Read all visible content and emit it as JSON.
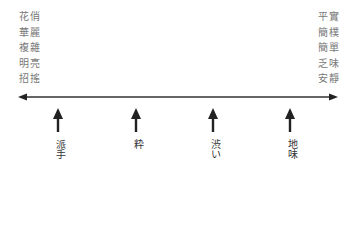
{
  "left_terms": [
    "花俏",
    "華麗",
    "複雜",
    "明亮",
    "招搖"
  ],
  "right_terms": [
    "平實",
    "簡樸",
    "簡單",
    "乏味",
    "安靜"
  ],
  "axis": {
    "type": "double-headed-arrow",
    "color": "#333333"
  },
  "markers": [
    {
      "label": "派手",
      "x": 58
    },
    {
      "label": "粋",
      "x": 136
    },
    {
      "label": "渋い",
      "x": 212
    },
    {
      "label": "地味",
      "x": 290
    }
  ]
}
